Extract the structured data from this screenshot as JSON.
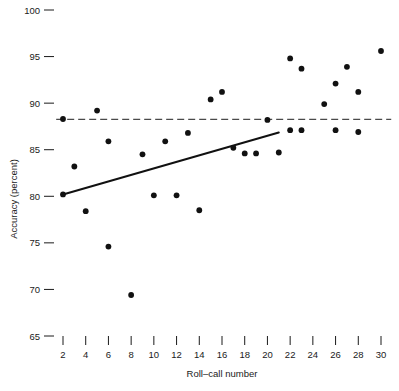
{
  "chart_data": {
    "type": "scatter",
    "title": "",
    "xlabel": "Roll–call  number",
    "ylabel": "Accuracy  (percent)",
    "xlim": [
      1,
      31
    ],
    "ylim": [
      65,
      100
    ],
    "grid": false,
    "legend": "none",
    "xticks": [
      2,
      4,
      6,
      8,
      10,
      12,
      14,
      16,
      18,
      20,
      22,
      24,
      26,
      28,
      30
    ],
    "xticklabels": [
      "2",
      "4",
      "6",
      "8",
      "10",
      "12",
      "14",
      "16",
      "18",
      "20",
      "22",
      "24",
      "26",
      "28",
      "30"
    ],
    "yticks": [
      65,
      70,
      75,
      80,
      85,
      90,
      95,
      100
    ],
    "yticklabels": [
      "65",
      "70",
      "75",
      "80",
      "85",
      "90",
      "95",
      "100"
    ],
    "points": [
      {
        "x": 2,
        "y": 88.3
      },
      {
        "x": 2,
        "y": 80.2
      },
      {
        "x": 3,
        "y": 83.2
      },
      {
        "x": 4,
        "y": 78.4
      },
      {
        "x": 5,
        "y": 89.2
      },
      {
        "x": 6,
        "y": 85.9
      },
      {
        "x": 6,
        "y": 74.6
      },
      {
        "x": 8,
        "y": 69.4
      },
      {
        "x": 9,
        "y": 84.5
      },
      {
        "x": 10,
        "y": 80.1
      },
      {
        "x": 11,
        "y": 85.9
      },
      {
        "x": 12,
        "y": 80.1
      },
      {
        "x": 13,
        "y": 86.8
      },
      {
        "x": 14,
        "y": 78.5
      },
      {
        "x": 15,
        "y": 90.4
      },
      {
        "x": 16,
        "y": 91.2
      },
      {
        "x": 17,
        "y": 85.2
      },
      {
        "x": 18,
        "y": 84.6
      },
      {
        "x": 19,
        "y": 84.6
      },
      {
        "x": 20,
        "y": 88.2
      },
      {
        "x": 21,
        "y": 84.7
      },
      {
        "x": 22,
        "y": 94.8
      },
      {
        "x": 22,
        "y": 87.1
      },
      {
        "x": 23,
        "y": 87.1
      },
      {
        "x": 23,
        "y": 93.7
      },
      {
        "x": 25,
        "y": 89.9
      },
      {
        "x": 26,
        "y": 92.1
      },
      {
        "x": 26,
        "y": 87.1
      },
      {
        "x": 27,
        "y": 93.9
      },
      {
        "x": 28,
        "y": 91.2
      },
      {
        "x": 28,
        "y": 86.9
      },
      {
        "x": 30,
        "y": 95.6
      }
    ],
    "series": [
      {
        "name": "reference-line",
        "style": "dashed",
        "x": [
          1.4,
          30.9
        ],
        "y": [
          88.25,
          88.25
        ]
      },
      {
        "name": "trend-line",
        "style": "solid",
        "x": [
          2.0,
          21.0
        ],
        "y": [
          80.2,
          86.85
        ]
      }
    ]
  },
  "axes": {
    "y_axis_label": "Accuracy  (percent)",
    "x_axis_label": "Roll–call  number"
  }
}
